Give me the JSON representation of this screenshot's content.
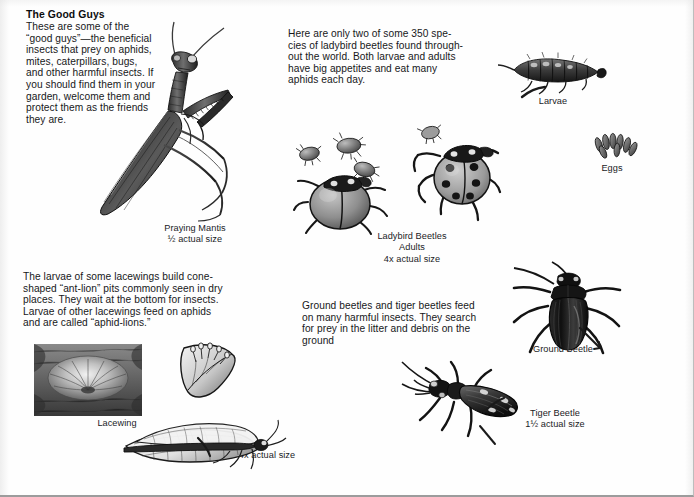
{
  "page": {
    "title": "The Good Guys",
    "background_color": "#fefefe",
    "ink_color": "#17181a"
  },
  "intro": {
    "heading": "The Good Guys",
    "body": "These are some of the\n“good guys”—the beneficial\ninsects that prey on aphids,\nmites, caterpillars, bugs,\nand other harmful insects. If\nyou should find them in your\ngarden, welcome them and\nprotect them as the friends\nthey are."
  },
  "ladybird_text": {
    "body": "Here are only two of some 350 spe-\ncies of ladybird beetles found through-\nout the world. Both larvae and adults\nhave big appetites and eat many\naphids each day."
  },
  "lacewing_text": {
    "body": "The larvae of some lacewings build cone-\nshaped “ant-lion” pits commonly seen in dry\nplaces. They wait at the bottom for insects.\nLarvae of other lacewings feed on aphids\nand are called “aphid-lions.”"
  },
  "ground_beetle_text": {
    "body": "Ground beetles and tiger beetles feed\non many harmful insects. They search\nfor prey in the litter and debris on the\nground"
  },
  "captions": {
    "praying_mantis": "Praying Mantis\n½ actual size",
    "larvae": "Larvae",
    "eggs": "Eggs",
    "ladybird_beetles": "Ladybird Beetles\nAdults\n4x actual size",
    "lacewing": "Lacewing",
    "lacewing_scale": "4x actual size",
    "ground_beetle": "Ground Beetle",
    "tiger_beetle": "Tiger Beetle\n1½ actual size"
  },
  "illustrations": [
    {
      "name": "praying-mantis",
      "subject": "Praying Mantis"
    },
    {
      "name": "ladybird-larva",
      "subject": "Ladybird beetle larva"
    },
    {
      "name": "ladybird-eggs",
      "subject": "Ladybird beetle eggs"
    },
    {
      "name": "ladybird-adult-plain",
      "subject": "Ladybird beetle adult, unspotted"
    },
    {
      "name": "ladybird-adult-spotted",
      "subject": "Ladybird beetle adult, spotted"
    },
    {
      "name": "aphids",
      "subject": "Aphids"
    },
    {
      "name": "ant-lion-pit",
      "subject": "Ant-lion pit in dry soil"
    },
    {
      "name": "lacewing-egg-leaf",
      "subject": "Lacewing eggs on leaf"
    },
    {
      "name": "lacewing-adult",
      "subject": "Adult lacewing"
    },
    {
      "name": "ground-beetle",
      "subject": "Ground Beetle"
    },
    {
      "name": "tiger-beetle",
      "subject": "Tiger Beetle"
    }
  ]
}
